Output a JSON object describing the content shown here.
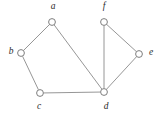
{
  "figure": {
    "width": 160,
    "height": 119,
    "background_color": "#ffffff"
  },
  "style": {
    "edge_color": "#8a8a8a",
    "vertex_stroke_color": "#6f6f6f",
    "vertex_fill_color": "#ffffff",
    "label_color": "#2b2b2b",
    "vertex_radius": 3.4,
    "edge_width": 0.9
  },
  "chart_data": {
    "type": "diagram",
    "graph_type": "undirected",
    "title": "",
    "vertices": [
      {
        "id": "a",
        "label": "a",
        "x": 52,
        "y": 22,
        "label_x": 53,
        "label_y": 7
      },
      {
        "id": "b",
        "label": "b",
        "x": 21,
        "y": 53,
        "label_x": 11,
        "label_y": 52
      },
      {
        "id": "c",
        "label": "c",
        "x": 40,
        "y": 93,
        "label_x": 39,
        "label_y": 107
      },
      {
        "id": "d",
        "label": "d",
        "x": 104,
        "y": 92,
        "label_x": 106,
        "label_y": 107
      },
      {
        "id": "e",
        "label": "e",
        "x": 139,
        "y": 54,
        "label_x": 151,
        "label_y": 53
      },
      {
        "id": "f",
        "label": "f",
        "x": 104,
        "y": 22,
        "label_x": 104,
        "label_y": 7
      }
    ],
    "edges": [
      {
        "source": "a",
        "target": "b"
      },
      {
        "source": "a",
        "target": "d"
      },
      {
        "source": "b",
        "target": "c"
      },
      {
        "source": "c",
        "target": "d"
      },
      {
        "source": "d",
        "target": "e"
      },
      {
        "source": "d",
        "target": "f"
      },
      {
        "source": "e",
        "target": "f"
      }
    ],
    "vertex_count": 6,
    "edge_count": 7
  }
}
